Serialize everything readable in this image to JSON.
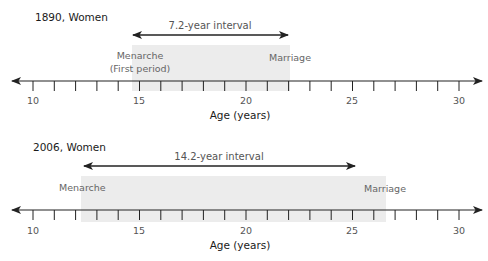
{
  "figure": {
    "axis_range": [
      10,
      30
    ],
    "axis_title": "Age (years)",
    "tick_labels": [
      "10",
      "15",
      "20",
      "25",
      "30"
    ],
    "panels": [
      {
        "title": "1890, Women",
        "interval_label": "7.2-year interval",
        "menarche_label": "Menarche",
        "menarche_sublabel": "(First period)",
        "marriage_label": "Marriage",
        "menarche_age": 14.8,
        "marriage_age": 22.0,
        "interval_years": 7.2
      },
      {
        "title": "2006, Women",
        "interval_label": "14.2-year interval",
        "menarche_label": "Menarche",
        "marriage_label": "Marriage",
        "menarche_age": 12.5,
        "marriage_age": 26.7,
        "interval_years": 14.2
      }
    ],
    "colors": {
      "shade": "#ececec",
      "axis": "#222222",
      "event_text": "#666666"
    }
  }
}
